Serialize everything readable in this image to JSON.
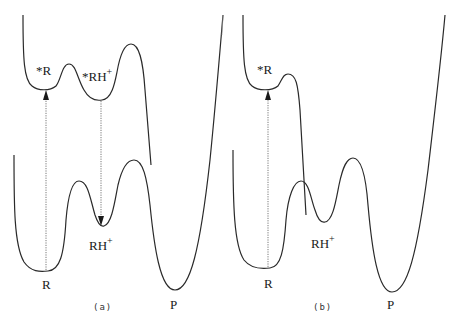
{
  "figure": {
    "panels": [
      {
        "id": "a",
        "caption": "(a)",
        "labels": {
          "excited_reactant": "*R",
          "excited_protonated": "*RH",
          "excited_protonated_charge": "+",
          "protonated": "RH",
          "protonated_charge": "+",
          "reactant": "R",
          "product": "P"
        },
        "arrows": [
          {
            "name": "excitation-arrow",
            "direction": "up",
            "from": "R",
            "to": "*R"
          },
          {
            "name": "emission-arrow",
            "direction": "down",
            "from": "*RH+",
            "to": "RH+"
          }
        ]
      },
      {
        "id": "b",
        "caption": "(b)",
        "labels": {
          "excited_reactant": "*R",
          "protonated": "RH",
          "protonated_charge": "+",
          "reactant": "R",
          "product": "P"
        },
        "arrows": [
          {
            "name": "excitation-arrow",
            "direction": "up",
            "from": "R",
            "to": "*R"
          }
        ]
      }
    ],
    "colors": {
      "line": "#2a2a2a",
      "arrow": "#555555",
      "background": "#ffffff"
    }
  }
}
